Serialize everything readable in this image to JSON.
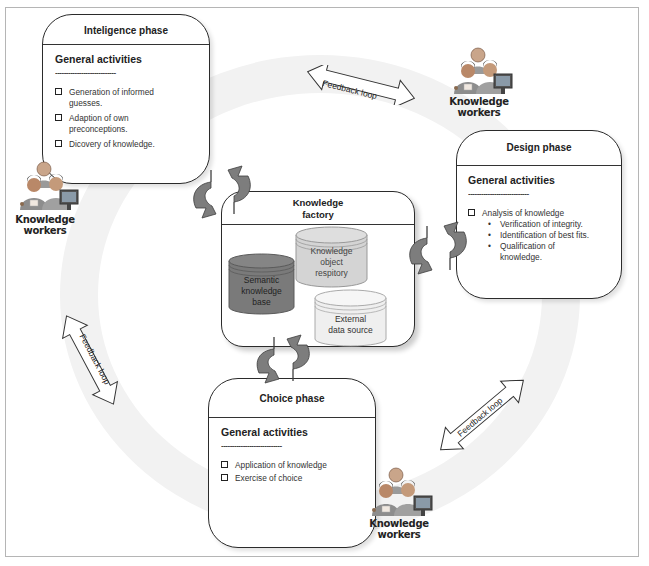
{
  "diagram": {
    "intelligence_phase": {
      "title": "Inteligence phase",
      "section": "General activities",
      "divider": "----------------------------",
      "items": [
        {
          "line1": "Generation of informed",
          "line2": "guesses."
        },
        {
          "line1": "Adaption of own",
          "line2": "preconceptions."
        },
        {
          "line1": "Dicovery of knowledge.",
          "line2": ""
        }
      ]
    },
    "design_phase": {
      "title": "Design phase",
      "section": "General activities",
      "divider": "----------------------------",
      "item": "Analysis of knowledge",
      "subitems": [
        {
          "bullet": "•",
          "line1": "Verification of integrity.",
          "line2": ""
        },
        {
          "bullet": "•",
          "line1": "Identification of best fits.",
          "line2": ""
        },
        {
          "bullet": "•",
          "line1": "Qualification of",
          "line2": "knowledge."
        }
      ]
    },
    "choice_phase": {
      "title": "Choice phase",
      "section": "General activities",
      "divider": "----------------------------",
      "items": [
        "Application of knowledge",
        "Exercise of choice"
      ]
    },
    "knowledge_factory": {
      "title_line1": "Knowledge",
      "title_line2": "factory",
      "databases": {
        "semantic": {
          "l1": "Semantic",
          "l2": "knowledge",
          "l3": "base",
          "color": "#7a7a7a"
        },
        "repository": {
          "l1": "Knowledge",
          "l2": "object",
          "l3": "respitory",
          "color": "#d4d4d4"
        },
        "external": {
          "l1": "External",
          "l2": "data source",
          "color": "#efefef"
        }
      }
    },
    "knowledge_workers": {
      "line1": "Knowledge",
      "line2": "workers"
    },
    "feedback_loop_label": "Feedback loop",
    "colors": {
      "cycle_arrow": "#7d7d7d",
      "border": "#2b2b2b",
      "ring": "#f2f2f2"
    }
  }
}
